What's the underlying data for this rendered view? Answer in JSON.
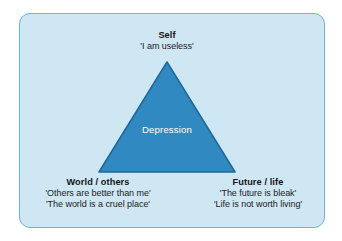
{
  "diagram": {
    "type": "triangle-diagram",
    "panel": {
      "background_color": "#cfe7f2",
      "border_color": "#6cb7d8"
    },
    "shape": {
      "name": "triangle",
      "fill_color": "#3189c1",
      "stroke_color": "#1d6a9c",
      "center_label": "Depression"
    },
    "nodes": [
      {
        "id": "self",
        "position": "top",
        "title": "Self",
        "quotes": [
          "'I am useless'"
        ]
      },
      {
        "id": "world-others",
        "position": "bottom-left",
        "title": "World / others",
        "quotes": [
          "'Others are better than me'",
          "'The world is a cruel place'"
        ]
      },
      {
        "id": "future-life",
        "position": "bottom-right",
        "title": "Future / life",
        "quotes": [
          "'The future is bleak'",
          "'Life is not worth living'"
        ]
      }
    ]
  }
}
